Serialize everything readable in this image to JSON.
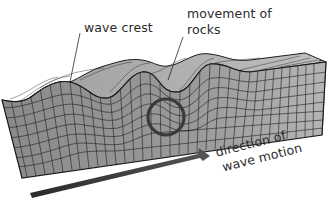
{
  "diagram": {
    "type": "surface-wave-block",
    "labels": {
      "wave_crest": "wave crest",
      "movement_line1": "movement of",
      "movement_line2": "rocks",
      "direction_line1": "direction of",
      "direction_line2": "wave motion"
    },
    "colors": {
      "block_front": "#8e8e8e",
      "block_top": "#a9a9a9",
      "block_side": "#b8b8b8",
      "grid": "#1e1e1e",
      "arrow": "#333333",
      "text": "#2b2b2b"
    }
  }
}
